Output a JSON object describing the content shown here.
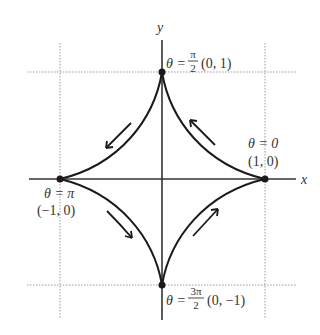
{
  "diagram": {
    "axes": {
      "x_label": "x",
      "y_label": "y"
    },
    "colors": {
      "curve": "#1a1a1a",
      "axis": "#333333",
      "grid": "#9a9a9a",
      "text": "#333333"
    },
    "points": [
      {
        "id": "top",
        "theta_prefix": "θ =",
        "theta_num": "π",
        "theta_den": "2",
        "coord": "(0, 1)"
      },
      {
        "id": "right",
        "theta": "θ = 0",
        "coord": "(1, 0)"
      },
      {
        "id": "left",
        "theta": "θ = π",
        "coord": "(−1, 0)"
      },
      {
        "id": "bottom",
        "theta_prefix": "θ =",
        "theta_num": "3π",
        "theta_den": "2",
        "coord": "(0, −1)"
      }
    ],
    "arrows": [
      {
        "quadrant": "upper-left",
        "direction": "down-left"
      },
      {
        "quadrant": "upper-right",
        "direction": "up-left"
      },
      {
        "quadrant": "lower-left",
        "direction": "down-right"
      },
      {
        "quadrant": "lower-right",
        "direction": "up-right"
      }
    ]
  }
}
